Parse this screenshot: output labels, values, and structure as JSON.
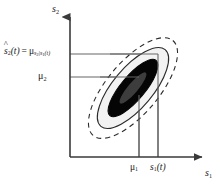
{
  "figure": {
    "axes": {
      "y_axis_label": "s",
      "y_axis_label_sub": "2",
      "x_axis_label": "s",
      "x_axis_label_sub": "1",
      "origin_px": [
        70,
        157
      ],
      "x_axis_end_px": [
        205,
        157
      ],
      "y_axis_end_px": [
        70,
        14
      ]
    },
    "labels": {
      "estimate_lhs_symbol": "s",
      "estimate_lhs_sub": "2",
      "estimate_lhs_arg": "(t)",
      "estimate_equals": "=",
      "estimate_rhs_symbol": "μ",
      "estimate_rhs_sub_num": "s",
      "estimate_rhs_sub_num_sub": "2",
      "estimate_rhs_sub_bar": "|",
      "estimate_rhs_sub_den": "s",
      "estimate_rhs_sub_den_sub": "1",
      "estimate_rhs_sub_den_arg": "(t)",
      "estimate_full_text": "ŝ₂(t) = μₛ₂|ₛ₁(t)",
      "mu2": "μ",
      "mu2_sub": "2",
      "mu1": "μ",
      "mu1_sub": "1",
      "s1t": "s",
      "s1t_sub": "1",
      "s1t_arg": "(t)"
    },
    "guide_lines": [
      {
        "name": "horizontal-estimate-line",
        "orientation": "horizontal",
        "y_px": 54,
        "x_from_px": 70,
        "x_to_px": 158,
        "value_label": "ŝ₂(t)"
      },
      {
        "name": "horizontal-mu2-line",
        "orientation": "horizontal",
        "y_px": 77,
        "x_from_px": 70,
        "x_to_px": 139,
        "value_label": "μ₂"
      },
      {
        "name": "vertical-mu1-line",
        "orientation": "vertical",
        "x_px": 139,
        "y_from_px": 77,
        "y_to_px": 157,
        "value_label": "μ₁"
      },
      {
        "name": "vertical-s1t-line",
        "orientation": "vertical",
        "x_px": 158,
        "y_from_px": 54,
        "y_to_px": 157,
        "value_label": "s₁(t)"
      }
    ],
    "contours": [
      {
        "name": "outer-dashed-contour",
        "style": "dashed",
        "fill": "none",
        "stroke": "#2b2b2b",
        "center_px": [
          133,
          88
        ],
        "rx": 62,
        "ry": 26,
        "rotation_deg": -50
      },
      {
        "name": "middle-solid-contour",
        "style": "solid",
        "fill": "#f2f2f2",
        "stroke": "#2b2b2b",
        "center_px": [
          133,
          88
        ],
        "rx": 50,
        "ry": 20,
        "rotation_deg": -50
      },
      {
        "name": "inner-black-contour",
        "style": "solid",
        "fill": "#050505",
        "stroke": "#050505",
        "center_px": [
          133,
          88
        ],
        "rx": 36,
        "ry": 12,
        "rotation_deg": -50
      },
      {
        "name": "core-gray-contour",
        "style": "solid",
        "fill": "#3d3d3d",
        "stroke": "none",
        "center_px": [
          133,
          88
        ],
        "rx": 20,
        "ry": 5,
        "rotation_deg": -50
      }
    ],
    "colors": {
      "background": "#ffffff",
      "line": "#666666",
      "axis": "#3a3a3a",
      "contour_stroke": "#2b2b2b",
      "contour_mid_fill": "#f2f2f2",
      "contour_inner_fill": "#050505",
      "contour_core_fill": "#3d3d3d",
      "text": "#1a1a1a"
    }
  }
}
